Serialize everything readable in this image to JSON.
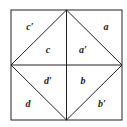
{
  "diagram": {
    "type": "square-dissection",
    "square": {
      "x1": 11,
      "y1": 10,
      "x2": 122,
      "y2": 120
    },
    "colors": {
      "line": "#222222",
      "background": "#ffffff",
      "text": "#222222"
    },
    "labels": [
      {
        "id": "c-prime",
        "text": "c′",
        "x": 30,
        "y": 30
      },
      {
        "id": "a",
        "text": "a",
        "x": 106,
        "y": 30
      },
      {
        "id": "c",
        "text": "c",
        "x": 48,
        "y": 53
      },
      {
        "id": "a-prime",
        "text": "a′",
        "x": 83,
        "y": 53
      },
      {
        "id": "d-prime",
        "text": "d′",
        "x": 48,
        "y": 84
      },
      {
        "id": "b",
        "text": "b",
        "x": 83,
        "y": 84
      },
      {
        "id": "d",
        "text": "d",
        "x": 28,
        "y": 107
      },
      {
        "id": "b-prime",
        "text": "b′",
        "x": 102,
        "y": 107
      }
    ]
  }
}
